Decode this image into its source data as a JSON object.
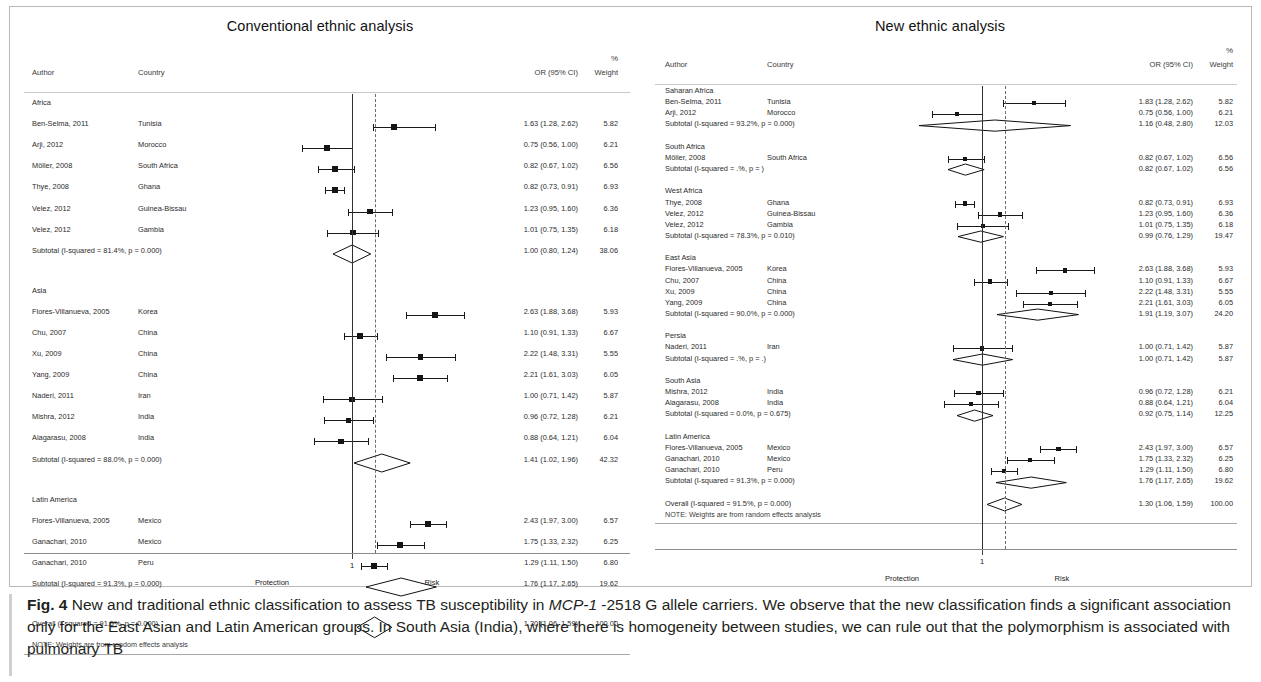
{
  "figure": {
    "label": "Fig. 4",
    "caption_parts": {
      "p1": " New and traditional ethnic classification to assess TB susceptibility in ",
      "em1": "MCP-1",
      "p2": " -2518 G allele carriers. We observe that the new classification finds a significant association only for the East Asian and Latin American groups. In South Asia (India), where there is homogeneity between studies, we can rule out that the polymorphism is associated with pulmonary TB"
    },
    "caption_full": "Fig. 4 New and traditional ethnic classification to assess TB susceptibility in MCP-1 -2518 G allele carriers. We observe that the new classification finds a significant association only for the East Asian and Latin American groups. In South Asia (India), where there is homogeneity between studies, we can rule out that the polymorphism is associated with pulmonary TB"
  },
  "columns": {
    "author": "Author",
    "country": "Country",
    "or": "OR (95% CI)",
    "weight_pct": "%",
    "weight": "Weight"
  },
  "axis": {
    "tick_label": "1",
    "left_label": "Protection",
    "right_label": "Risk"
  },
  "note": "NOTE: Weights are from random effects analysis",
  "chart_data": {
    "type": "forest",
    "title": "New and traditional ethnic classification to assess TB susceptibility in MCP-1 -2518 G allele carriers",
    "xlabel": "Odds ratio",
    "ylabel": "",
    "reference_line": 1,
    "xscale": "log",
    "panels": [
      {
        "title": "Conventional ethnic analysis",
        "overall_line": 1.3,
        "groups": [
          {
            "name": "Africa",
            "rows": [
              {
                "author": "Ben-Selma, 2011",
                "country": "Tunisia",
                "or": 1.63,
                "lo": 1.28,
                "hi": 2.62,
                "weight": 5.82,
                "or_text": "1.63 (1.28, 2.62)",
                "weight_text": "5.82"
              },
              {
                "author": "Arji, 2012",
                "country": "Morocco",
                "or": 0.75,
                "lo": 0.56,
                "hi": 1.0,
                "weight": 6.21,
                "or_text": "0.75 (0.56, 1.00)",
                "weight_text": "6.21"
              },
              {
                "author": "Möller, 2008",
                "country": "South Africa",
                "or": 0.82,
                "lo": 0.67,
                "hi": 1.02,
                "weight": 6.56,
                "or_text": "0.82 (0.67, 1.02)",
                "weight_text": "6.56"
              },
              {
                "author": "Thye, 2008",
                "country": "Ghana",
                "or": 0.82,
                "lo": 0.73,
                "hi": 0.91,
                "weight": 6.93,
                "or_text": "0.82 (0.73, 0.91)",
                "weight_text": "6.93"
              },
              {
                "author": "Velez,  2012",
                "country": "Guinea-Bissau",
                "or": 1.23,
                "lo": 0.95,
                "hi": 1.6,
                "weight": 6.36,
                "or_text": "1.23 (0.95, 1.60)",
                "weight_text": "6.36"
              },
              {
                "author": "Velez,  2012",
                "country": "Gambia",
                "or": 1.01,
                "lo": 0.75,
                "hi": 1.35,
                "weight": 6.18,
                "or_text": "1.01 (0.75, 1.35)",
                "weight_text": "6.18"
              }
            ],
            "subtotal": {
              "label": "Subtotal  (I-squared = 81.4%, p = 0.000)",
              "or": 1.0,
              "lo": 0.8,
              "hi": 1.24,
              "weight": 38.06,
              "or_text": "1.00 (0.80, 1.24)",
              "weight_text": "38.06"
            }
          },
          {
            "name": "Asia",
            "rows": [
              {
                "author": "Flores-Villanueva, 2005",
                "country": "Korea",
                "or": 2.63,
                "lo": 1.88,
                "hi": 3.68,
                "weight": 5.93,
                "or_text": "2.63 (1.88, 3.68)",
                "weight_text": "5.93",
                "clipped": true
              },
              {
                "author": "Chu, 2007",
                "country": "China",
                "or": 1.1,
                "lo": 0.91,
                "hi": 1.33,
                "weight": 6.67,
                "or_text": "1.10 (0.91, 1.33)",
                "weight_text": "6.67"
              },
              {
                "author": "Xu, 2009",
                "country": "China",
                "or": 2.22,
                "lo": 1.48,
                "hi": 3.31,
                "weight": 5.55,
                "or_text": "2.22 (1.48, 3.31)",
                "weight_text": "5.55"
              },
              {
                "author": "Yang, 2009",
                "country": "China",
                "or": 2.21,
                "lo": 1.61,
                "hi": 3.03,
                "weight": 6.05,
                "or_text": "2.21 (1.61, 3.03)",
                "weight_text": "6.05"
              },
              {
                "author": "Naderi, 2011",
                "country": "Iran",
                "or": 1.0,
                "lo": 0.71,
                "hi": 1.42,
                "weight": 5.87,
                "or_text": "1.00 (0.71, 1.42)",
                "weight_text": "5.87"
              },
              {
                "author": "Mishra, 2012",
                "country": "India",
                "or": 0.96,
                "lo": 0.72,
                "hi": 1.28,
                "weight": 6.21,
                "or_text": "0.96 (0.72, 1.28)",
                "weight_text": "6.21"
              },
              {
                "author": "Alagarasu, 2008",
                "country": "India",
                "or": 0.88,
                "lo": 0.64,
                "hi": 1.21,
                "weight": 6.04,
                "or_text": "0.88 (0.64, 1.21)",
                "weight_text": "6.04"
              }
            ],
            "subtotal": {
              "label": "Subtotal  (I-squared = 88.0%, p = 0.000)",
              "or": 1.41,
              "lo": 1.02,
              "hi": 1.96,
              "weight": 42.32,
              "or_text": "1.41 (1.02, 1.96)",
              "weight_text": "42.32"
            }
          },
          {
            "name": "Latin America",
            "rows": [
              {
                "author": "Flores-Villanueva, 2005",
                "country": "Mexico",
                "or": 2.43,
                "lo": 1.97,
                "hi": 3.0,
                "weight": 6.57,
                "or_text": "2.43 (1.97, 3.00)",
                "weight_text": "6.57"
              },
              {
                "author": "Ganachari, 2010",
                "country": "Mexico",
                "or": 1.75,
                "lo": 1.33,
                "hi": 2.32,
                "weight": 6.25,
                "or_text": "1.75 (1.33, 2.32)",
                "weight_text": "6.25"
              },
              {
                "author": "Ganachari, 2010",
                "country": "Peru",
                "or": 1.29,
                "lo": 1.11,
                "hi": 1.5,
                "weight": 6.8,
                "or_text": "1.29 (1.11, 1.50)",
                "weight_text": "6.80"
              }
            ],
            "subtotal": {
              "label": "Subtotal  (I-squared = 91.3%, p = 0.000)",
              "or": 1.76,
              "lo": 1.17,
              "hi": 2.65,
              "weight": 19.62,
              "or_text": "1.76 (1.17, 2.65)",
              "weight_text": "19.62"
            }
          }
        ],
        "overall": {
          "label": "Overall  (I-squared = 91.5%, p = 0.000)",
          "or": 1.3,
          "lo": 1.06,
          "hi": 1.59,
          "weight": 100.0,
          "or_text": "1.30 (1.06, 1.59)",
          "weight_text": "100.00"
        }
      },
      {
        "title": "New ethnic analysis",
        "overall_line": 1.3,
        "groups": [
          {
            "name": "Saharan Africa",
            "rows": [
              {
                "author": "Ben-Selma, 2011",
                "country": "Tunisia",
                "or": 1.83,
                "lo": 1.28,
                "hi": 2.62,
                "weight": 5.82,
                "or_text": "1.83 (1.28, 2.62)",
                "weight_text": "5.82"
              },
              {
                "author": "Arji, 2012",
                "country": "Morocco",
                "or": 0.75,
                "lo": 0.56,
                "hi": 1.0,
                "weight": 6.21,
                "or_text": "0.75 (0.56, 1.00)",
                "weight_text": "6.21"
              }
            ],
            "subtotal": {
              "label": "Subtotal  (I-squared = 93.2%, p = 0.000)",
              "or": 1.16,
              "lo": 0.48,
              "hi": 2.8,
              "weight": 12.03,
              "or_text": "1.16 (0.48, 2.80)",
              "weight_text": "12.03"
            }
          },
          {
            "name": "South Africa",
            "rows": [
              {
                "author": "Möller, 2008",
                "country": "South Africa",
                "or": 0.82,
                "lo": 0.67,
                "hi": 1.02,
                "weight": 6.56,
                "or_text": "0.82 (0.67, 1.02)",
                "weight_text": "6.56"
              }
            ],
            "subtotal": {
              "label": "Subtotal  (I-squared = .%, p = )",
              "or": 0.82,
              "lo": 0.67,
              "hi": 1.02,
              "weight": 6.56,
              "or_text": "0.82 (0.67, 1.02)",
              "weight_text": "6.56"
            }
          },
          {
            "name": "West Africa",
            "rows": [
              {
                "author": "Thye, 2008",
                "country": "Ghana",
                "or": 0.82,
                "lo": 0.73,
                "hi": 0.91,
                "weight": 6.93,
                "or_text": "0.82 (0.73, 0.91)",
                "weight_text": "6.93"
              },
              {
                "author": "Velez,  2012",
                "country": "Guinea-Bissau",
                "or": 1.23,
                "lo": 0.95,
                "hi": 1.6,
                "weight": 6.36,
                "or_text": "1.23 (0.95, 1.60)",
                "weight_text": "6.36"
              },
              {
                "author": "Velez,  2012",
                "country": "Gambia",
                "or": 1.01,
                "lo": 0.75,
                "hi": 1.35,
                "weight": 6.18,
                "or_text": "1.01 (0.75, 1.35)",
                "weight_text": "6.18"
              }
            ],
            "subtotal": {
              "label": "Subtotal  (I-squared = 78.3%, p = 0.010)",
              "or": 0.99,
              "lo": 0.76,
              "hi": 1.29,
              "weight": 19.47,
              "or_text": "0.99 (0.76, 1.29)",
              "weight_text": "19.47"
            }
          },
          {
            "name": "East Asia",
            "rows": [
              {
                "author": "Flores-Villanueva, 2005",
                "country": "Korea",
                "or": 2.63,
                "lo": 1.88,
                "hi": 3.68,
                "weight": 5.93,
                "or_text": "2.63 (1.88, 3.68)",
                "weight_text": "5.93",
                "clipped": true
              },
              {
                "author": "Chu, 2007",
                "country": "China",
                "or": 1.1,
                "lo": 0.91,
                "hi": 1.33,
                "weight": 6.67,
                "or_text": "1.10 (0.91, 1.33)",
                "weight_text": "6.67"
              },
              {
                "author": "Xu, 2009",
                "country": "China",
                "or": 2.22,
                "lo": 1.48,
                "hi": 3.31,
                "weight": 5.55,
                "or_text": "2.22 (1.48, 3.31)",
                "weight_text": "5.55"
              },
              {
                "author": "Yang, 2009",
                "country": "China",
                "or": 2.21,
                "lo": 1.61,
                "hi": 3.03,
                "weight": 6.05,
                "or_text": "2.21 (1.61, 3.03)",
                "weight_text": "6.05"
              }
            ],
            "subtotal": {
              "label": "Subtotal  (I-squared = 90.0%, p = 0.000)",
              "or": 1.91,
              "lo": 1.19,
              "hi": 3.07,
              "weight": 24.2,
              "or_text": "1.91 (1.19, 3.07)",
              "weight_text": "24.20"
            }
          },
          {
            "name": "Persia",
            "rows": [
              {
                "author": "Naderi, 2011",
                "country": "Iran",
                "or": 1.0,
                "lo": 0.71,
                "hi": 1.42,
                "weight": 5.87,
                "or_text": "1.00 (0.71, 1.42)",
                "weight_text": "5.87"
              }
            ],
            "subtotal": {
              "label": "Subtotal  (I-squared = .%, p = .)",
              "or": 1.0,
              "lo": 0.71,
              "hi": 1.42,
              "weight": 5.87,
              "or_text": "1.00 (0.71, 1.42)",
              "weight_text": "5.87"
            }
          },
          {
            "name": "South Asia",
            "rows": [
              {
                "author": "Mishra, 2012",
                "country": "India",
                "or": 0.96,
                "lo": 0.72,
                "hi": 1.28,
                "weight": 6.21,
                "or_text": "0.96 (0.72, 1.28)",
                "weight_text": "6.21"
              },
              {
                "author": "Alagarasu, 2008",
                "country": "India",
                "or": 0.88,
                "lo": 0.64,
                "hi": 1.21,
                "weight": 6.04,
                "or_text": "0.88 (0.64, 1.21)",
                "weight_text": "6.04"
              }
            ],
            "subtotal": {
              "label": "Subtotal  (I-squared = 0.0%, p = 0.675)",
              "or": 0.92,
              "lo": 0.75,
              "hi": 1.14,
              "weight": 12.25,
              "or_text": "0.92 (0.75, 1.14)",
              "weight_text": "12.25"
            }
          },
          {
            "name": "Latin America",
            "rows": [
              {
                "author": "Flores-Villanueva, 2005",
                "country": "Mexico",
                "or": 2.43,
                "lo": 1.97,
                "hi": 3.0,
                "weight": 6.57,
                "or_text": "2.43 (1.97, 3.00)",
                "weight_text": "6.57"
              },
              {
                "author": "Ganachari, 2010",
                "country": "Mexico",
                "or": 1.75,
                "lo": 1.33,
                "hi": 2.32,
                "weight": 6.25,
                "or_text": "1.75 (1.33, 2.32)",
                "weight_text": "6.25"
              },
              {
                "author": "Ganachari, 2010",
                "country": "Peru",
                "or": 1.29,
                "lo": 1.11,
                "hi": 1.5,
                "weight": 6.8,
                "or_text": "1.29 (1.11, 1.50)",
                "weight_text": "6.80"
              }
            ],
            "subtotal": {
              "label": "Subtotal  (I-squared = 91.3%, p = 0.000)",
              "or": 1.76,
              "lo": 1.17,
              "hi": 2.65,
              "weight": 19.62,
              "or_text": "1.76 (1.17, 2.65)",
              "weight_text": "19.62"
            }
          }
        ],
        "overall": {
          "label": "Overall  (I-squared = 91.5%, p = 0.000)",
          "or": 1.3,
          "lo": 1.06,
          "hi": 1.59,
          "weight": 100.0,
          "or_text": "1.30 (1.06, 1.59)",
          "weight_text": "100.00"
        }
      }
    ]
  }
}
